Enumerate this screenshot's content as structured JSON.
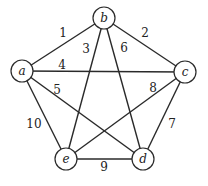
{
  "diagram": {
    "type": "weighted-graph",
    "nodes": [
      {
        "id": "a",
        "label": "a",
        "x": 22,
        "y": 71
      },
      {
        "id": "b",
        "label": "b",
        "x": 104,
        "y": 18
      },
      {
        "id": "c",
        "label": "c",
        "x": 185,
        "y": 72
      },
      {
        "id": "d",
        "label": "d",
        "x": 143,
        "y": 159
      },
      {
        "id": "e",
        "label": "e",
        "x": 66,
        "y": 159
      }
    ],
    "edges": [
      {
        "from": "a",
        "to": "b",
        "weight": "1",
        "lx": 63,
        "ly": 37
      },
      {
        "from": "b",
        "to": "c",
        "weight": "2",
        "lx": 145,
        "ly": 37
      },
      {
        "from": "b",
        "to": "e",
        "weight": "3",
        "lx": 86,
        "ly": 53
      },
      {
        "from": "a",
        "to": "c",
        "weight": "4",
        "lx": 62,
        "ly": 69
      },
      {
        "from": "a",
        "to": "d",
        "weight": "5",
        "lx": 57,
        "ly": 94
      },
      {
        "from": "b",
        "to": "d",
        "weight": "6",
        "lx": 124,
        "ly": 52
      },
      {
        "from": "c",
        "to": "d",
        "weight": "7",
        "lx": 172,
        "ly": 128
      },
      {
        "from": "c",
        "to": "e",
        "weight": "8",
        "lx": 153,
        "ly": 92
      },
      {
        "from": "e",
        "to": "d",
        "weight": "9",
        "lx": 104,
        "ly": 171
      },
      {
        "from": "a",
        "to": "e",
        "weight": "10",
        "lx": 34,
        "ly": 128
      }
    ]
  }
}
